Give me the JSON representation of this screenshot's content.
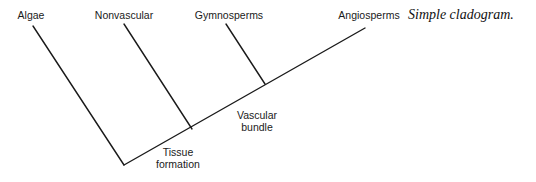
{
  "caption": "Simple cladogram.",
  "taxa": [
    {
      "label": "Algae",
      "x": 31,
      "y": 19
    },
    {
      "label": "Nonvascular",
      "x": 124,
      "y": 19
    },
    {
      "label": "Gymnosperms",
      "x": 229,
      "y": 19
    },
    {
      "label": "Angiosperms",
      "x": 369,
      "y": 19
    }
  ],
  "nodes": [
    {
      "label_lines": [
        "Tissue",
        "formation"
      ],
      "x": 178,
      "y1": 156,
      "y2": 168
    },
    {
      "label_lines": [
        "Vascular",
        "bundle"
      ],
      "x": 257,
      "y1": 119,
      "y2": 131
    }
  ],
  "branches": [
    {
      "name": "main-stem",
      "x1": 124,
      "y1": 165,
      "x2": 365,
      "y2": 28
    },
    {
      "name": "algae-branch",
      "x1": 33,
      "y1": 26,
      "x2": 124,
      "y2": 165
    },
    {
      "name": "nonvascular-branch",
      "x1": 124,
      "y1": 24,
      "x2": 192,
      "y2": 129
    },
    {
      "name": "gymnosperms-branch",
      "x1": 226,
      "y1": 24,
      "x2": 265,
      "y2": 84
    }
  ],
  "colors": {
    "line": "#1a1a1a",
    "text": "#1a1a1a",
    "background": "#ffffff"
  }
}
